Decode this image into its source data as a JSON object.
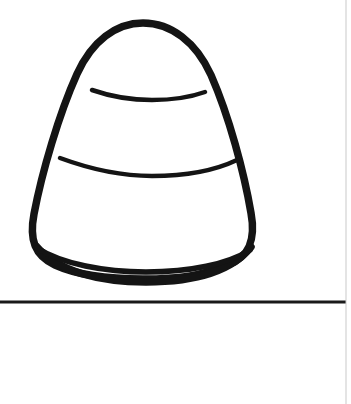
{
  "canvas": {
    "width": 351,
    "height": 404,
    "background_color": "#ffffff",
    "ink_color": "#111111",
    "title": "Candy Corn Line Drawing",
    "description": "Black outline drawing of a candy corn with two horizontal stripe bands and a ground line below."
  },
  "drawing": {
    "name": "candy-corn",
    "style": "coloring-page outline",
    "stroke_color": "#141414",
    "fill_color": "#ffffff",
    "outline_stroke_width": 7.5,
    "band_stroke_width": 4.5,
    "bounds": {
      "left": 33,
      "top": 20,
      "right": 254,
      "bottom": 283
    },
    "apex": {
      "x": 143,
      "y": 22
    },
    "parts": [
      {
        "name": "body-outline",
        "label": "Candy corn body outline",
        "path": "M 143 23 C 171 23 196 42 211 75 C 229 116 244 172 251 213 C 256 240 249 257 228 265 C 200 276 180 279 143 279 C 106 279 77 275 55 265 C 35 256 29 240 34 214 C 42 172 59 114 77 74 C 92 41 116 23 143 23 Z"
      },
      {
        "name": "band-upper",
        "label": "Upper stripe band divider",
        "path": "M 92 90 C 115 98 135 100 152 100 C 172 100 191 97 205 92"
      },
      {
        "name": "band-lower",
        "label": "Lower stripe band divider",
        "path": "M 60 158 C 98 172 127 176 152 176 C 186 176 216 170 237 160"
      },
      {
        "name": "bottom-rim-inner",
        "label": "Inner bottom edge of candy corn body",
        "path": "M 37 248 C 62 264 105 272 146 272 C 190 272 228 264 250 250"
      },
      {
        "name": "bottom-rim-outer",
        "label": "Outer bottom rim of candy corn",
        "path": "M 36 246 C 58 272 100 282 146 282 C 194 282 232 271 251 247"
      }
    ]
  },
  "ground_line": {
    "name": "ground-line",
    "label": "Horizontal ground line",
    "y": 302,
    "x_start": 0,
    "x_end": 346,
    "stroke_width": 3,
    "color": "#1a1a1a"
  },
  "page_edge": {
    "name": "page-right-edge",
    "label": "Faint scanned page right edge",
    "x": 346,
    "y_start": 0,
    "y_end": 404,
    "stroke_width": 1,
    "color": "#c9c9c9"
  }
}
